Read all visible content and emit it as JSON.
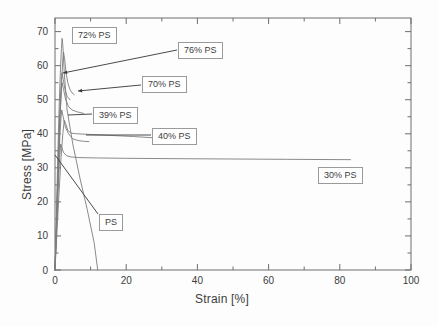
{
  "chart_data": {
    "type": "line",
    "title": "",
    "xlabel": "Strain [%]",
    "ylabel": "Stress [MPa]",
    "xlim": [
      0,
      100
    ],
    "ylim": [
      0,
      74
    ],
    "xticks": [
      0,
      20,
      40,
      60,
      80,
      100
    ],
    "yticks": [
      0,
      10,
      20,
      30,
      40,
      50,
      60,
      70
    ],
    "xtick_minor_step": 10,
    "ytick_minor_step": 5,
    "grid": false,
    "legend_position": "inline-annotations",
    "series": [
      {
        "name": "PS",
        "peak_stress": 68.0,
        "peak_strain": 2.0,
        "break_strain": 12.0,
        "points": [
          [
            0,
            0
          ],
          [
            0.35,
            14
          ],
          [
            0.7,
            30
          ],
          [
            1.1,
            46
          ],
          [
            1.5,
            58
          ],
          [
            1.8,
            65
          ],
          [
            2.0,
            68
          ],
          [
            2.2,
            66
          ],
          [
            2.6,
            58
          ],
          [
            3.4,
            47
          ],
          [
            5.0,
            37
          ],
          [
            7.0,
            27
          ],
          [
            9.0,
            18
          ],
          [
            11.0,
            8
          ],
          [
            12.0,
            0
          ]
        ]
      },
      {
        "name": "72% PS",
        "peak_stress": 64.0,
        "peak_strain": 2.4,
        "break_strain": 5.4,
        "points": [
          [
            0,
            0
          ],
          [
            0.4,
            12
          ],
          [
            0.9,
            28
          ],
          [
            1.4,
            44
          ],
          [
            1.9,
            56
          ],
          [
            2.2,
            62
          ],
          [
            2.4,
            64
          ],
          [
            2.7,
            62
          ],
          [
            3.1,
            58
          ],
          [
            3.6,
            55
          ],
          [
            4.2,
            53
          ],
          [
            4.8,
            52
          ],
          [
            5.4,
            51.5
          ]
        ]
      },
      {
        "name": "76% PS",
        "peak_stress": 58.0,
        "peak_strain": 2.0,
        "break_strain": 4.2,
        "points": [
          [
            0,
            0
          ],
          [
            0.4,
            14
          ],
          [
            0.9,
            32
          ],
          [
            1.4,
            48
          ],
          [
            1.8,
            56
          ],
          [
            2.0,
            58
          ],
          [
            2.3,
            56
          ],
          [
            2.8,
            53
          ],
          [
            3.4,
            51
          ],
          [
            4.2,
            50
          ]
        ]
      },
      {
        "name": "70% PS",
        "peak_stress": 55.0,
        "peak_strain": 2.0,
        "break_strain": 8.0,
        "points": [
          [
            0,
            0
          ],
          [
            0.4,
            13
          ],
          [
            0.9,
            30
          ],
          [
            1.4,
            45
          ],
          [
            1.8,
            53
          ],
          [
            2.0,
            55
          ],
          [
            2.4,
            53
          ],
          [
            3.0,
            50
          ],
          [
            3.8,
            48
          ],
          [
            4.8,
            47
          ],
          [
            6.0,
            46.5
          ],
          [
            8.0,
            46
          ]
        ]
      },
      {
        "name": "39% PS",
        "peak_stress": 47.0,
        "peak_strain": 1.9,
        "break_strain": 9.5,
        "points": [
          [
            0,
            0
          ],
          [
            0.4,
            12
          ],
          [
            0.9,
            27
          ],
          [
            1.4,
            40
          ],
          [
            1.7,
            45
          ],
          [
            1.9,
            47
          ],
          [
            2.3,
            45
          ],
          [
            2.9,
            42
          ],
          [
            3.8,
            40
          ],
          [
            5.0,
            38.5
          ],
          [
            6.5,
            38
          ],
          [
            8.0,
            37.8
          ],
          [
            9.5,
            37.7
          ]
        ]
      },
      {
        "name": "40% PS",
        "peak_stress": 44.0,
        "peak_strain": 2.6,
        "break_strain": 28.0,
        "points": [
          [
            0,
            0
          ],
          [
            0.5,
            10
          ],
          [
            1.1,
            22
          ],
          [
            1.7,
            33
          ],
          [
            2.2,
            40
          ],
          [
            2.5,
            43
          ],
          [
            2.6,
            44
          ],
          [
            3.0,
            43
          ],
          [
            3.6,
            41
          ],
          [
            4.5,
            40.2
          ],
          [
            6.0,
            40
          ],
          [
            10.0,
            39.8
          ],
          [
            16.0,
            39.5
          ],
          [
            22.0,
            39.2
          ],
          [
            28.0,
            38.8
          ]
        ]
      },
      {
        "name": "30% PS",
        "peak_stress": 37.0,
        "peak_strain": 1.6,
        "break_strain": 83.0,
        "points": [
          [
            0,
            0
          ],
          [
            0.4,
            11
          ],
          [
            0.9,
            24
          ],
          [
            1.3,
            33
          ],
          [
            1.6,
            37
          ],
          [
            1.9,
            36
          ],
          [
            2.4,
            34.5
          ],
          [
            3.2,
            33.6
          ],
          [
            4.5,
            33.2
          ],
          [
            7.0,
            33.0
          ],
          [
            12.0,
            32.9
          ],
          [
            20.0,
            32.8
          ],
          [
            32.0,
            32.7
          ],
          [
            48.0,
            32.6
          ],
          [
            65.0,
            32.5
          ],
          [
            83.0,
            32.4
          ]
        ]
      }
    ],
    "annotations": [
      {
        "label": "72% PS",
        "box_x": 72,
        "box_y": 27,
        "has_leader": false
      },
      {
        "label": "76% PS",
        "box_x": 178,
        "box_y": 42,
        "has_leader": true
      },
      {
        "label": "70% PS",
        "box_x": 142,
        "box_y": 76,
        "has_leader": true
      },
      {
        "label": "39% PS",
        "box_x": 93,
        "box_y": 107,
        "has_leader": true
      },
      {
        "label": "40% PS",
        "box_x": 152,
        "box_y": 128,
        "has_leader": true
      },
      {
        "label": "30% PS",
        "box_x": 318,
        "box_y": 167,
        "has_leader": false
      },
      {
        "label": "PS",
        "box_x": 99,
        "box_y": 214,
        "has_leader": true
      }
    ],
    "axis_color": "#6e6e6e",
    "curve_color": "#7d7d7d",
    "text_color": "#3c3c3c"
  }
}
